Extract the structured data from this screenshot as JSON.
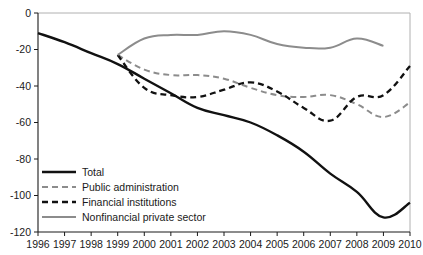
{
  "chart_data": {
    "type": "line",
    "title": "",
    "xlabel": "",
    "ylabel": "",
    "xlim": [
      1996,
      2010
    ],
    "ylim": [
      -120,
      0
    ],
    "ytick_step": 20,
    "grid": false,
    "legend_position": "bottom-left",
    "x": [
      1996,
      1997,
      1998,
      1999,
      2000,
      2001,
      2002,
      2003,
      2004,
      2005,
      2006,
      2007,
      2008,
      2009,
      2010
    ],
    "xtick_labels": [
      "1996",
      "1997",
      "1998",
      "1999",
      "2000",
      "2001",
      "2002",
      "2003",
      "2004",
      "2005",
      "2006",
      "2007",
      "2008",
      "2009",
      "2010"
    ],
    "ytick_labels": [
      "0",
      "-20",
      "-40",
      "-60",
      "-80",
      "-100",
      "-120"
    ],
    "ytick_values": [
      0,
      -20,
      -40,
      -60,
      -80,
      -100,
      -120
    ],
    "series": [
      {
        "name": "Total",
        "style": "solid",
        "color": "#111111",
        "width": 2.4,
        "x": [
          1996,
          1997,
          1998,
          1999,
          2000,
          2001,
          2002,
          2003,
          2004,
          2005,
          2006,
          2007,
          2008,
          2009,
          2010
        ],
        "values": [
          -11,
          -16,
          -22,
          -28,
          -36,
          -44,
          -52,
          -56,
          -60,
          -67,
          -76,
          -88,
          -98,
          -112,
          -104
        ]
      },
      {
        "name": "Public administration",
        "style": "dashed",
        "color": "#8c8c8c",
        "width": 2.0,
        "x": [
          1999,
          2000,
          2001,
          2002,
          2003,
          2004,
          2005,
          2006,
          2007,
          2008,
          2009,
          2010
        ],
        "values": [
          -23,
          -31,
          -34,
          -34,
          -36,
          -41,
          -45,
          -46,
          -45,
          -50,
          -57,
          -49
        ]
      },
      {
        "name": "Financial institutions",
        "style": "dashed",
        "color": "#111111",
        "width": 2.3,
        "x": [
          1999,
          2000,
          2001,
          2002,
          2003,
          2004,
          2005,
          2006,
          2007,
          2008,
          2009,
          2010
        ],
        "values": [
          -23,
          -41,
          -45,
          -46,
          -42,
          -38,
          -43,
          -52,
          -59,
          -46,
          -45,
          -29
        ]
      },
      {
        "name": "Nonfinancial private sector",
        "style": "solid",
        "color": "#8c8c8c",
        "width": 2.0,
        "x": [
          1999,
          2000,
          2001,
          2002,
          2003,
          2004,
          2005,
          2006,
          2007,
          2008,
          2009
        ],
        "values": [
          -23,
          -14,
          -12,
          -12,
          -10,
          -12,
          -17,
          -19,
          -19,
          -14,
          -18
        ]
      }
    ],
    "legend": [
      {
        "label": "Total",
        "style": "solid",
        "color": "#111111",
        "width": 2.4
      },
      {
        "label": "Public administration",
        "style": "dashed",
        "color": "#8c8c8c",
        "width": 2.0
      },
      {
        "label": "Financial institutions",
        "style": "dashed",
        "color": "#111111",
        "width": 2.3
      },
      {
        "label": "Nonfinancial private sector",
        "style": "solid",
        "color": "#8c8c8c",
        "width": 2.0
      }
    ]
  }
}
